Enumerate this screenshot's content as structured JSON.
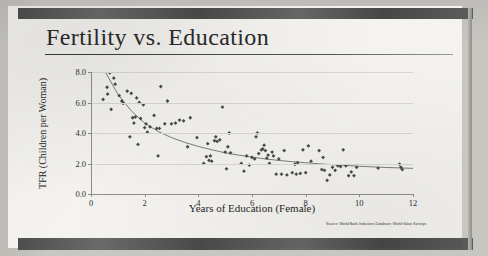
{
  "slide": {
    "title": "Fertility vs. Education",
    "source_note": "Source: World Bank Indicators Database; World Value Surveys."
  },
  "chart_data": {
    "type": "scatter",
    "title": "Fertility vs. Education",
    "xlabel": "Years of Education (Female)",
    "ylabel": "TFR (Children per Woman)",
    "xlim": [
      0,
      12
    ],
    "ylim": [
      0,
      8
    ],
    "xticks": [
      "0",
      "2",
      "4",
      "6",
      "8",
      "10",
      "12"
    ],
    "yticks": [
      "0.0",
      "2.0",
      "4.0",
      "6.0",
      "8.0"
    ],
    "grid": "horizontal",
    "legend": "none",
    "marker": "diamond",
    "marker_color": "#4a4a4a",
    "trend_color": "#6f6f6f",
    "trend_label": "fitted decay curve",
    "points": [
      [
        0.45,
        6.2
      ],
      [
        0.6,
        7.0
      ],
      [
        0.62,
        6.55
      ],
      [
        0.7,
        7.95
      ],
      [
        0.75,
        5.55
      ],
      [
        0.85,
        7.6
      ],
      [
        0.9,
        7.2
      ],
      [
        1.05,
        6.45
      ],
      [
        1.15,
        6.1
      ],
      [
        1.2,
        5.95
      ],
      [
        1.35,
        6.75
      ],
      [
        1.45,
        3.75
      ],
      [
        1.5,
        6.6
      ],
      [
        1.55,
        5.0
      ],
      [
        1.6,
        4.65
      ],
      [
        1.65,
        5.05
      ],
      [
        1.7,
        6.3
      ],
      [
        1.75,
        3.25
      ],
      [
        1.8,
        6.0
      ],
      [
        1.85,
        4.95
      ],
      [
        1.95,
        5.85
      ],
      [
        2.0,
        4.35
      ],
      [
        2.05,
        4.6
      ],
      [
        2.1,
        4.05
      ],
      [
        2.2,
        4.4
      ],
      [
        2.35,
        5.15
      ],
      [
        2.45,
        4.3
      ],
      [
        2.5,
        2.5
      ],
      [
        2.55,
        4.3
      ],
      [
        2.6,
        7.05
      ],
      [
        2.75,
        4.6
      ],
      [
        2.85,
        6.1
      ],
      [
        3.0,
        4.6
      ],
      [
        3.15,
        4.65
      ],
      [
        3.3,
        4.85
      ],
      [
        3.45,
        4.8
      ],
      [
        3.6,
        3.1
      ],
      [
        3.7,
        5.0
      ],
      [
        3.95,
        3.7
      ],
      [
        4.2,
        2.0
      ],
      [
        4.3,
        2.45
      ],
      [
        4.35,
        3.3
      ],
      [
        4.4,
        2.2
      ],
      [
        4.45,
        2.5
      ],
      [
        4.5,
        2.15
      ],
      [
        4.6,
        3.5
      ],
      [
        4.65,
        3.75
      ],
      [
        4.7,
        3.45
      ],
      [
        4.8,
        3.55
      ],
      [
        4.9,
        5.7
      ],
      [
        5.0,
        2.75
      ],
      [
        5.05,
        1.65
      ],
      [
        5.1,
        3.1
      ],
      [
        5.15,
        4.0
      ],
      [
        5.2,
        2.7
      ],
      [
        5.6,
        2.0
      ],
      [
        5.7,
        1.5
      ],
      [
        5.8,
        2.5
      ],
      [
        5.9,
        1.9
      ],
      [
        6.0,
        2.4
      ],
      [
        6.1,
        2.3
      ],
      [
        6.15,
        3.75
      ],
      [
        6.2,
        4.0
      ],
      [
        6.25,
        2.65
      ],
      [
        6.35,
        2.9
      ],
      [
        6.4,
        2.95
      ],
      [
        6.45,
        3.2
      ],
      [
        6.5,
        2.85
      ],
      [
        6.55,
        2.35
      ],
      [
        6.6,
        2.55
      ],
      [
        6.65,
        2.0
      ],
      [
        6.75,
        2.75
      ],
      [
        6.8,
        2.5
      ],
      [
        6.9,
        1.3
      ],
      [
        7.0,
        2.3
      ],
      [
        7.1,
        1.3
      ],
      [
        7.2,
        2.85
      ],
      [
        7.3,
        1.25
      ],
      [
        7.5,
        1.4
      ],
      [
        7.6,
        1.95
      ],
      [
        7.65,
        1.3
      ],
      [
        7.7,
        2.05
      ],
      [
        7.8,
        1.35
      ],
      [
        7.9,
        2.9
      ],
      [
        8.0,
        1.4
      ],
      [
        8.1,
        3.15
      ],
      [
        8.2,
        2.15
      ],
      [
        8.5,
        2.85
      ],
      [
        8.6,
        1.6
      ],
      [
        8.65,
        2.4
      ],
      [
        8.7,
        1.55
      ],
      [
        8.8,
        0.9
      ],
      [
        8.9,
        1.25
      ],
      [
        9.0,
        1.75
      ],
      [
        9.1,
        1.55
      ],
      [
        9.2,
        1.85
      ],
      [
        9.3,
        1.8
      ],
      [
        9.4,
        2.9
      ],
      [
        9.5,
        1.85
      ],
      [
        9.6,
        1.2
      ],
      [
        9.7,
        1.45
      ],
      [
        9.8,
        1.2
      ],
      [
        9.9,
        1.75
      ],
      [
        10.7,
        1.7
      ],
      [
        11.5,
        1.95
      ],
      [
        11.55,
        1.75
      ],
      [
        11.6,
        1.6
      ]
    ],
    "trend_curve": {
      "description": "TFR declines steeply from ~8 near 0 years to ~1.7 by 12 years",
      "x": [
        0.55,
        1.0,
        1.5,
        2.0,
        2.5,
        3.0,
        3.5,
        4.0,
        4.5,
        5.0,
        5.5,
        6.0,
        6.5,
        7.0,
        7.5,
        8.0,
        8.5,
        9.0,
        9.5,
        10.0,
        10.5,
        11.0,
        11.5,
        12.0
      ],
      "y": [
        7.95,
        6.55,
        5.45,
        4.65,
        4.1,
        3.7,
        3.38,
        3.12,
        2.9,
        2.7,
        2.55,
        2.42,
        2.3,
        2.2,
        2.12,
        2.05,
        1.98,
        1.92,
        1.87,
        1.82,
        1.78,
        1.74,
        1.71,
        1.68
      ]
    }
  }
}
